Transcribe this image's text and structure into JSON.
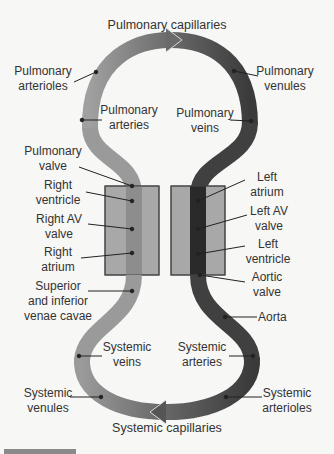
{
  "diagram": {
    "title": "Pulmonary capillaries",
    "bottom_title": "Systemic capillaries",
    "colors": {
      "deoxygenated": "#9a9a9a",
      "oxygenated": "#3f3f3f",
      "heart_chamber": "#a8a8a8",
      "background": "#f7f7f5"
    },
    "labels": {
      "pulmonary_arterioles": [
        "Pulmonary",
        "arterioles"
      ],
      "pulmonary_venules": [
        "Pulmonary",
        "venules"
      ],
      "pulmonary_arteries": [
        "Pulmonary",
        "arteries"
      ],
      "pulmonary_veins": [
        "Pulmonary",
        "veins"
      ],
      "pulmonary_valve": [
        "Pulmonary",
        "valve"
      ],
      "right_ventricle": [
        "Right",
        "ventricle"
      ],
      "right_av_valve": [
        "Right AV",
        "valve"
      ],
      "right_atrium": [
        "Right",
        "atrium"
      ],
      "venae_cavae": [
        "Superior",
        "and inferior",
        "venae cavae"
      ],
      "left_atrium": [
        "Left",
        "atrium"
      ],
      "left_av_valve": [
        "Left AV",
        "valve"
      ],
      "left_ventricle": [
        "Left",
        "ventricle"
      ],
      "aortic_valve": [
        "Aortic",
        "valve"
      ],
      "aorta": [
        "Aorta"
      ],
      "systemic_veins": [
        "Systemic",
        "veins"
      ],
      "systemic_arteries": [
        "Systemic",
        "arteries"
      ],
      "systemic_venules": [
        "Systemic",
        "venules"
      ],
      "systemic_arterioles": [
        "Systemic",
        "arterioles"
      ]
    }
  }
}
